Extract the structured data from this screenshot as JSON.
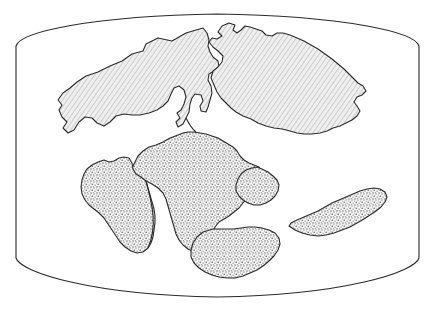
{
  "figure": {
    "title": "Pangaea breakup paleogeographic map",
    "type": "line-art map",
    "projection_label": "oval world projection frame",
    "background_color": "#ffffff",
    "outline_color": "#2b2b2b",
    "frame": {
      "name": "map-border",
      "stroke": "#2b2b2b",
      "stroke_width": 1.1,
      "left_x": 16,
      "right_x": 419,
      "top_y": 14,
      "bottom_y": 297,
      "side_top_y": 46,
      "side_bottom_y": 258
    }
  },
  "legend": {
    "laurasia_fill_label": "diagonal-hatch",
    "laurasia_fill_color": "#d8d8d8",
    "gondwana_fill_label": "stipple-dot",
    "gondwana_fill_color": "#c9c9c9"
  },
  "landmasses": [
    {
      "id": "laurasia-north-america",
      "label": "North America (Laurasia west)",
      "texture": "diagonal-hatch",
      "path": "M 203 28 L 186 33 L 172 41 L 158 38 L 146 44 L 143 51 L 132 54 L 122 61 L 110 66 L 98 72 L 86 76 L 77 82 L 70 88 L 63 93 L 58 100 L 62 105 L 59 110 L 62 117 L 67 122 L 63 128 L 68 133 L 74 130 L 79 122 L 85 117 L 92 118 L 97 123 L 104 126 L 110 122 L 116 116 L 124 114 L 132 115 L 140 115 L 149 113 L 157 110 L 163 106 L 168 101 L 171 94 L 174 88 L 179 86 L 184 90 L 186 97 L 184 104 L 181 110 L 177 113 L 180 118 L 176 122 L 178 127 L 183 124 L 186 118 L 189 112 L 190 104 L 192 98 L 195 94 L 201 95 L 203 101 L 200 106 L 201 111 L 206 112 L 208 107 L 210 100 L 212 93 L 211 86 L 208 80 L 209 74 L 214 71 L 219 68 L 218 61 L 213 57 L 210 52 L 208 46 L 209 40 L 207 33 Z"
    },
    {
      "id": "laurasia-eurasia",
      "label": "Eurasia (Laurasia east)",
      "texture": "diagonal-hatch",
      "path": "M 229 23 L 222 26 L 218 32 L 222 36 L 217 39 L 212 38 L 209 42 L 213 47 L 218 51 L 223 56 L 222 62 L 218 67 L 213 71 L 211 78 L 214 85 L 217 92 L 221 98 L 226 103 L 231 108 L 236 112 L 243 116 L 251 119 L 258 123 L 266 126 L 274 128 L 282 129 L 290 131 L 297 133 L 304 134 L 312 134 L 320 133 L 327 131 L 333 128 L 340 126 L 346 123 L 352 120 L 357 116 L 360 111 L 357 106 L 354 102 L 357 97 L 362 95 L 366 91 L 363 86 L 358 83 L 354 79 L 349 74 L 344 69 L 338 64 L 332 59 L 325 54 L 318 49 L 311 45 L 304 41 L 297 38 L 290 35 L 283 33 L 277 33 L 272 36 L 266 35 L 262 31 L 256 29 L 250 27 L 245 26 L 241 30 L 237 33 L 233 30 L 235 25 Z"
    },
    {
      "id": "gondwana-africa",
      "label": "Africa",
      "texture": "stipple-dot",
      "path": "M 178 135 L 170 138 L 163 142 L 156 145 L 149 147 L 143 151 L 138 156 L 135 162 L 132 168 L 135 174 L 140 178 L 146 181 L 152 184 L 158 188 L 163 193 L 166 199 L 168 206 L 170 213 L 172 220 L 174 227 L 176 234 L 179 240 L 183 245 L 188 249 L 194 252 L 200 253 L 206 251 L 210 246 L 212 240 L 213 233 L 215 227 L 219 222 L 224 219 L 229 216 L 234 212 L 239 208 L 243 203 L 247 198 L 250 192 L 252 186 L 255 181 L 259 177 L 262 172 L 259 167 L 254 165 L 249 163 L 244 160 L 240 156 L 237 151 L 233 147 L 228 144 L 223 141 L 218 138 L 212 136 L 206 134 L 200 133 L 194 132 L 188 132 L 183 133 Z"
    },
    {
      "id": "gondwana-south-america",
      "label": "South America",
      "texture": "stipple-dot",
      "path": "M 98 162 L 92 165 L 87 169 L 84 174 L 82 180 L 81 187 L 82 194 L 85 200 L 89 205 L 94 209 L 99 213 L 104 218 L 108 224 L 112 230 L 116 236 L 120 242 L 125 247 L 131 251 L 137 253 L 143 252 L 148 248 L 151 243 L 153 237 L 154 230 L 155 223 L 155 216 L 154 209 L 152 202 L 150 195 L 148 188 L 146 181 L 141 177 L 136 174 L 133 169 L 132 163 L 129 158 L 124 157 L 119 158 L 114 161 L 109 162 L 104 160 Z"
    },
    {
      "id": "gondwana-india",
      "label": "India",
      "texture": "stipple-dot",
      "path": "M 252 168 L 246 170 L 241 174 L 238 179 L 236 185 L 236 191 L 239 196 L 243 200 L 248 203 L 254 205 L 260 205 L 266 203 L 271 200 L 275 196 L 278 191 L 279 185 L 277 180 L 273 176 L 268 172 L 262 169 L 257 167 Z"
    },
    {
      "id": "gondwana-antarctica",
      "label": "Antarctica",
      "texture": "stipple-dot",
      "path": "M 203 232 L 197 237 L 193 243 L 191 250 L 191 257 L 194 263 L 199 268 L 205 272 L 212 275 L 219 277 L 227 278 L 235 278 L 243 276 L 250 273 L 257 270 L 263 266 L 269 261 L 274 256 L 278 250 L 280 244 L 279 238 L 275 233 L 269 230 L 262 228 L 255 227 L 248 227 L 241 228 L 234 229 L 227 229 L 220 229 L 213 229 Z"
    },
    {
      "id": "gondwana-australia",
      "label": "Australia",
      "texture": "stipple-dot",
      "path": "M 289 226 L 295 230 L 302 233 L 310 235 L 318 236 L 326 235 L 334 233 L 342 230 L 350 227 L 357 223 L 364 219 L 370 215 L 376 211 L 381 207 L 385 202 L 387 197 L 385 192 L 380 189 L 374 188 L 367 189 L 360 191 L 353 194 L 346 197 L 339 200 L 332 203 L 325 207 L 318 211 L 311 214 L 304 217 L 297 220 L 291 223 Z"
    }
  ],
  "internal_boundaries": [
    {
      "id": "africa-south-america-rift",
      "label": "South Atlantic rift line",
      "path": "M 146 181 C 149 192 152 203 153 215 C 154 227 152 239 148 248"
    },
    {
      "id": "laurasia-gondwana-seam",
      "label": "Tethys seam",
      "path": "M 186 118 C 189 124 192 129 196 132"
    }
  ]
}
